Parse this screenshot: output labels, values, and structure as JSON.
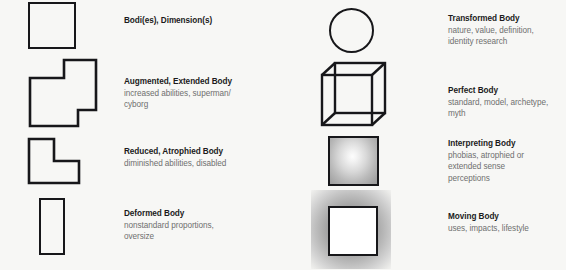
{
  "page": {
    "background_color": "#f7f7f5",
    "text_color_title": "#1b1b1b",
    "text_color_sub": "#6f6f6f",
    "stroke_color": "#17171a"
  },
  "columns": [
    {
      "name": "left",
      "entries": [
        {
          "icon": "outlined-square-shape",
          "title": "Bodi(es), Dimension(s)",
          "subtitle": ""
        },
        {
          "icon": "stepped-notched-polygon-shape",
          "title": "Augmented, Extended Body",
          "subtitle": "increased abilities, superman/\ncyborg"
        },
        {
          "icon": "l-shape-polygon",
          "title": "Reduced, Atrophied Body",
          "subtitle": "diminished abilities, disabled"
        },
        {
          "icon": "tall-narrow-rectangle-shape",
          "title": "Deformed Body",
          "subtitle": "nonstandard proportions,\noversize"
        }
      ]
    },
    {
      "name": "right",
      "entries": [
        {
          "icon": "outlined-circle-shape",
          "title": "Transformed Body",
          "subtitle": "nature, value, definition,\nidentity research"
        },
        {
          "icon": "wireframe-cube-shape",
          "title": "Perfect Body",
          "subtitle": "standard, model, archetype,\nmyth"
        },
        {
          "icon": "radial-gradient-square-shape",
          "title": "Interpreting Body",
          "subtitle": "phobias, atrophied or\nextended sense\nperceptions"
        },
        {
          "icon": "glowing-white-square-shape",
          "title": "Moving Body",
          "subtitle": "uses, impacts, lifestyle"
        }
      ]
    }
  ]
}
